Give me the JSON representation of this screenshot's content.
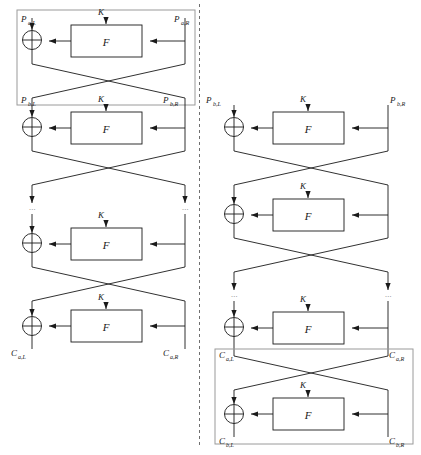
{
  "figure": {
    "type": "feistel-cipher-diagram",
    "divider": "dashed-vertical-line",
    "stroke_color": "#1a1a1a",
    "frame_color": "#9a9a9a",
    "ellipsis": "···"
  },
  "labels": {
    "function_box": "F",
    "key": "K",
    "ellipsis": "···"
  },
  "left_diagram": {
    "name": "left-feistel-network",
    "inputs": {
      "top_left": "P",
      "top_left_sub": "a,L",
      "top_right": "P",
      "top_right_sub": "a,R",
      "mid_left": "P",
      "mid_left_sub": "b,L",
      "mid_right": "P",
      "mid_right_sub": "b,R"
    },
    "outputs": {
      "bottom_left": "C",
      "bottom_left_sub": "a,L",
      "bottom_right": "C",
      "bottom_right_sub": "a,R"
    },
    "rounds": [
      {
        "index": 1,
        "key": "K",
        "func": "F"
      },
      {
        "index": 2,
        "key": "K",
        "func": "F"
      },
      {
        "index": 3,
        "key": "K",
        "func": "F"
      },
      {
        "index": 4,
        "key": "K",
        "func": "F"
      }
    ],
    "highlight_frame": "round-1-group"
  },
  "right_diagram": {
    "name": "right-feistel-network",
    "inputs": {
      "top_left": "P",
      "top_left_sub": "b,L",
      "top_right": "P",
      "top_right_sub": "b,R",
      "mid_left": "C",
      "mid_left_sub": "a,L",
      "mid_right": "C",
      "mid_right_sub": "a,R"
    },
    "outputs": {
      "bottom_left": "C",
      "bottom_left_sub": "b,L",
      "bottom_right": "C",
      "bottom_right_sub": "b,R"
    },
    "rounds": [
      {
        "index": 1,
        "key": "K",
        "func": "F"
      },
      {
        "index": 2,
        "key": "K",
        "func": "F"
      },
      {
        "index": 3,
        "key": "K",
        "func": "F"
      },
      {
        "index": 4,
        "key": "K",
        "func": "F"
      }
    ],
    "highlight_frame": "last-round-group"
  }
}
